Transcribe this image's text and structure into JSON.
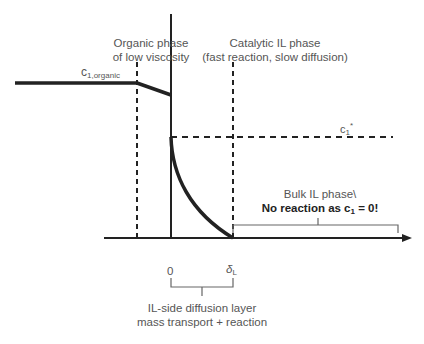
{
  "labels": {
    "organic_phase_line1": "Organic phase",
    "organic_phase_line2": "of low viscosity",
    "catalytic_phase_line1": "Catalytic IL phase",
    "catalytic_phase_line2": "(fast reaction, slow diffusion)",
    "c_organic_base": "c",
    "c_organic_sub": "1,organic",
    "c_star_base": "c",
    "c_star_sub": "1",
    "c_star_sup": "*",
    "bulk_line1": "Bulk IL phase\\",
    "bulk_line2_prefix": "No reaction as c",
    "bulk_line2_sub": "1",
    "bulk_line2_suffix": " = 0!",
    "tick_zero": "0",
    "tick_delta_base": "δ",
    "tick_delta_sub": "L",
    "diffusion_line1": "IL-side diffusion layer",
    "diffusion_line2": "mass transport + reaction"
  },
  "colors": {
    "line": "#222222",
    "text": "#555555"
  }
}
